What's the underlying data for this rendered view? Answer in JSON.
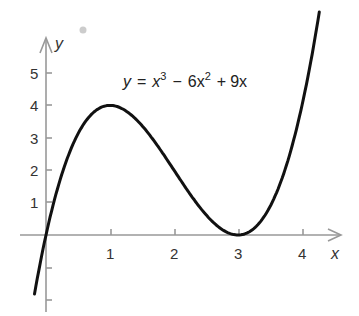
{
  "chart_data": {
    "type": "line",
    "title": "",
    "equation": "y = x^3 - 6x^2 + 9x",
    "equation_parts": {
      "lhs": "y",
      "eq": "=",
      "t1": "x",
      "e1": "3",
      "op1": "−",
      "t2": "6x",
      "e2": "2",
      "op2": "+",
      "t3": "9x"
    },
    "xlabel": "x",
    "ylabel": "y",
    "x_ticks": [
      "1",
      "2",
      "3",
      "4"
    ],
    "y_ticks": [
      "1",
      "2",
      "3",
      "4",
      "5"
    ],
    "xlim": [
      -0.25,
      4.6
    ],
    "ylim": [
      -2,
      5.8
    ],
    "grid": false,
    "series": [
      {
        "name": "y = x^3 - 6x^2 + 9x",
        "x": [
          -0.18,
          0,
          0.5,
          1,
          1.5,
          2,
          2.5,
          3,
          3.5,
          4,
          4.27
        ],
        "values": [
          -1.82,
          0,
          3.13,
          4,
          3.38,
          2,
          0.63,
          0,
          0.88,
          4,
          5.9
        ]
      }
    ],
    "annotations": [
      {
        "text": "local max (1, 4)"
      },
      {
        "text": "local min (3, 0)"
      }
    ]
  }
}
